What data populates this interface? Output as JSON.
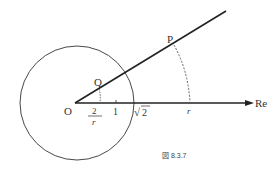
{
  "diagram": {
    "labels": {
      "origin": "O",
      "point_p": "P",
      "point_q": "Q",
      "axis": "Re",
      "frac_num": "2",
      "frac_den": "r",
      "tick_one": "1",
      "sqrt_sym": "√",
      "sqrt_val": "2",
      "r_label": "r"
    },
    "caption": "図 8.3.7",
    "colors": {
      "stroke": "#222222",
      "dashed": "#555555"
    }
  }
}
